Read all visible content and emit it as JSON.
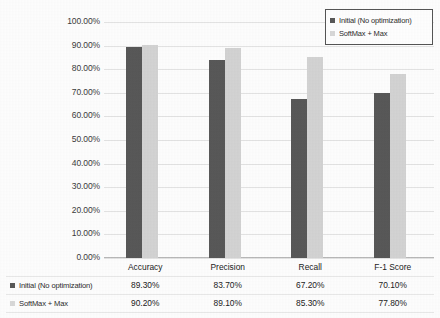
{
  "legend": {
    "items": [
      {
        "label": "Initial (No optimization)",
        "color": "#585858",
        "swatch": "legend-swatch-dark"
      },
      {
        "label": "SoftMax + Max",
        "color": "#d8d8d8",
        "swatch": "legend-swatch-light"
      }
    ]
  },
  "table": {
    "row_labels": [
      "Initial (No optimization)",
      "SoftMax + Max"
    ],
    "categories": [
      "Accuracy",
      "Precision",
      "Recall",
      "F-1 Score"
    ],
    "rows": [
      [
        "89.30%",
        "83.70%",
        "67.20%",
        "70.10%"
      ],
      [
        "90.20%",
        "89.10%",
        "85.30%",
        "77.80%"
      ]
    ]
  },
  "chart_data": {
    "type": "bar",
    "title": "",
    "xlabel": "",
    "ylabel": "",
    "categories": [
      "Accuracy",
      "Precision",
      "Recall",
      "F-1 Score"
    ],
    "series": [
      {
        "name": "Initial (No optimization)",
        "color": "#585858",
        "values": [
          89.3,
          83.7,
          67.2,
          70.1
        ]
      },
      {
        "name": "SoftMax + Max",
        "color": "#d3d3d3",
        "values": [
          90.2,
          89.1,
          85.3,
          77.8
        ]
      }
    ],
    "value_labels": [
      [
        "89.30%",
        "83.70%",
        "67.20%",
        "70.10%"
      ],
      [
        "90.20%",
        "89.10%",
        "85.30%",
        "77.80%"
      ]
    ],
    "ylim": [
      0,
      100
    ],
    "ytick_step": 10,
    "ytick_labels": [
      "0.00%",
      "10.00%",
      "20.00%",
      "30.00%",
      "40.00%",
      "50.00%",
      "60.00%",
      "70.00%",
      "80.00%",
      "90.00%",
      "100.00%"
    ],
    "ytick_values": [
      0,
      10,
      20,
      30,
      40,
      50,
      60,
      70,
      80,
      90,
      100
    ],
    "grid": true,
    "grid_axis": "y",
    "legend_position": "top-right",
    "has_data_table": true,
    "units": "percent"
  }
}
